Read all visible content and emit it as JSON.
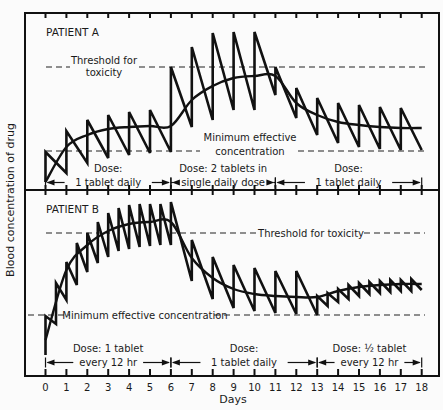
{
  "chart_data": {
    "type": "line",
    "title": "",
    "xlabel": "Days",
    "ylabel": "Blood concentration of drug",
    "x_ticks": [
      0,
      1,
      2,
      3,
      4,
      5,
      6,
      7,
      8,
      9,
      10,
      11,
      12,
      13,
      14,
      15,
      16,
      17,
      18
    ],
    "xlim": [
      0,
      18
    ],
    "grid": false,
    "panels": [
      {
        "label": "PATIENT A",
        "threshold_label": "Threshold for toxicity",
        "threshold_label_lines": [
          "Threshold for",
          "toxicity"
        ],
        "mec_label": "Minimum effective concentration",
        "mec_label_lines": [
          "Minimum effective",
          "concentration"
        ],
        "threshold_level": "high",
        "doses": [
          {
            "from": 0,
            "to": 6,
            "lines": [
              "Dose:",
              "1 tablet daily"
            ]
          },
          {
            "from": 6,
            "to": 11,
            "lines": [
              "Dose: 2 tablets in",
              "single daily dose"
            ]
          },
          {
            "from": 11,
            "to": 18,
            "lines": [
              "Dose:",
              "1 tablet daily"
            ]
          }
        ],
        "series": [
          {
            "name": "Fluctuating concentration (sawtooth)",
            "x": [
              0,
              0,
              1,
              1,
              2,
              2,
              3,
              3,
              4,
              4,
              5,
              5,
              6,
              6,
              7,
              7,
              8,
              8,
              9,
              9,
              10,
              10,
              11,
              11,
              12,
              12,
              13,
              13,
              14,
              14,
              15,
              15,
              16,
              16,
              17,
              17,
              18
            ],
            "y": [
              182,
              152,
              173,
              131,
              163,
              120,
              158,
              115,
              155,
              112,
              153,
              110,
              152,
              67,
              127,
              47,
              120,
              33,
              110,
              32,
              110,
              32,
              95,
              67,
              118,
              88,
              135,
              98,
              143,
              103,
              147,
              105,
              149,
              107,
              150,
              108,
              150
            ]
          },
          {
            "name": "Mean concentration (smooth)",
            "x": [
              0,
              1,
              2,
              3,
              4,
              5,
              6,
              7,
              8,
              9,
              10,
              11,
              12,
              13,
              14,
              15,
              16,
              17,
              18
            ],
            "y": [
              182,
              147,
              135,
              129,
              127,
              126,
              126,
              100,
              86,
              78,
              76,
              76,
              103,
              115,
              122,
              125,
              127,
              128,
              128
            ]
          }
        ],
        "threshold_y": 67,
        "mec_y": 151
      },
      {
        "label": "PATIENT B",
        "threshold_label": "Threshold for toxicity",
        "mec_label": "Minimum effective concentration",
        "doses": [
          {
            "from": 0,
            "to": 6,
            "lines": [
              "Dose: 1 tablet",
              "every 12 hr"
            ]
          },
          {
            "from": 6,
            "to": 13,
            "lines": [
              "Dose:",
              "1 tablet daily"
            ]
          },
          {
            "from": 13,
            "to": 18,
            "lines": [
              "Dose: ½ tablet",
              "every 12 hr"
            ]
          }
        ],
        "series": [
          {
            "name": "Fluctuating concentration (sawtooth)",
            "x": [
              0,
              0,
              0.5,
              0.5,
              1,
              1,
              1.5,
              1.5,
              2,
              2,
              2.5,
              2.5,
              3,
              3,
              3.5,
              3.5,
              4,
              4,
              4.5,
              4.5,
              5,
              5,
              5.5,
              5.5,
              6,
              6,
              7,
              7,
              8,
              8,
              9,
              9,
              10,
              10,
              11,
              11,
              12,
              12,
              13,
              13,
              13.5,
              13.5,
              14,
              14,
              14.5,
              14.5,
              15,
              15,
              15.5,
              15.5,
              16,
              16,
              16.5,
              16.5,
              17,
              17,
              17.5,
              17.5,
              18
            ],
            "y": [
              355,
              316,
              324,
              283,
              300,
              262,
              285,
              243,
              272,
              233,
              263,
              222,
              257,
              213,
              251,
              208,
              249,
              205,
              247,
              204,
              246,
              204,
              245,
              204,
              245,
              202,
              281,
              240,
              299,
              257,
              308,
              265,
              311,
              268,
              313,
              271,
              314,
              271,
              315,
              296,
              306,
              293,
              302,
              289,
              299,
              285,
              296,
              283,
              294,
              282,
              293,
              281,
              292,
              280,
              291,
              280,
              291,
              279,
              290
            ]
          },
          {
            "name": "Mean concentration (smooth)",
            "x": [
              0,
              1,
              2,
              3,
              4,
              5,
              6,
              7,
              8,
              9,
              10,
              11,
              12,
              13,
              14,
              15,
              16,
              17,
              18
            ],
            "y": [
              340,
              270,
              245,
              231,
              224,
              222,
              222,
              258,
              278,
              289,
              294,
              296,
              297,
              297,
              291,
              287,
              285,
              284,
              284
            ]
          }
        ],
        "threshold_y": 233,
        "mec_y": 315
      }
    ]
  }
}
